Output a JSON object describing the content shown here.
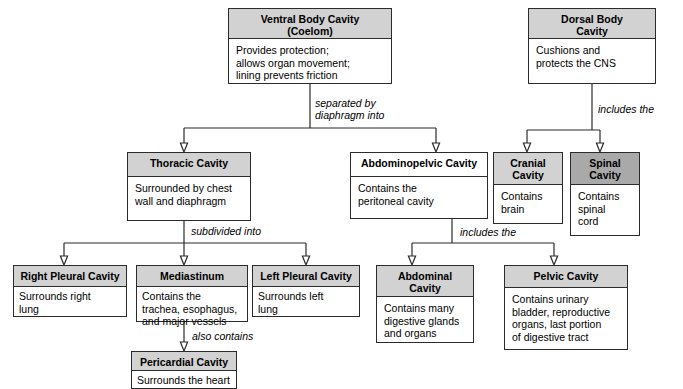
{
  "diagram": {
    "colors": {
      "header_fill": "#d2d2d2",
      "header_fill_dark": "#a9a9a9",
      "box_fill": "#ffffff",
      "line": "#2b2b2b"
    },
    "nodes": [
      {
        "id": "ventral-body-cavity",
        "header": "Ventral Body Cavity\n(Coelom)",
        "header_line1": "Ventral Body Cavity",
        "header_line2": "(Coelom)",
        "body": "Provides protection;\nallows organ movement;\nlining prevents friction",
        "body_line1": "Provides protection;",
        "body_line2": "allows organ movement;",
        "body_line3": "lining prevents friction"
      },
      {
        "id": "dorsal-body-cavity",
        "header_line1": "Dorsal Body",
        "header_line2": "Cavity",
        "body_line1": "Cushions and",
        "body_line2": "protects the CNS"
      },
      {
        "id": "thoracic-cavity",
        "header_line1": "Thoracic Cavity",
        "body_line1": "Surrounded by chest",
        "body_line2": "wall and diaphragm"
      },
      {
        "id": "abdominopelvic-cavity",
        "header_line1": "Abdominopelvic Cavity",
        "body_line1": "Contains the",
        "body_line2": "peritoneal cavity"
      },
      {
        "id": "cranial-cavity",
        "header_line1": "Cranial",
        "header_line2": "Cavity",
        "body_line1": "Contains",
        "body_line2": "brain"
      },
      {
        "id": "spinal-cavity",
        "header_line1": "Spinal",
        "header_line2": "Cavity",
        "body_line1": "Contains",
        "body_line2": "spinal",
        "body_line3": "cord"
      },
      {
        "id": "right-pleural-cavity",
        "header_line1": "Right Pleural Cavity",
        "body_line1": "Surrounds right",
        "body_line2": "lung"
      },
      {
        "id": "mediastinum",
        "header_line1": "Mediastinum",
        "body_line1": "Contains the",
        "body_line2": "trachea, esophagus,",
        "body_line3": "and major vessels"
      },
      {
        "id": "left-pleural-cavity",
        "header_line1": "Left Pleural Cavity",
        "body_line1": "Surrounds left",
        "body_line2": "lung"
      },
      {
        "id": "pericardial-cavity",
        "header_line1": "Pericardial Cavity",
        "body_line1": "Surrounds the heart"
      },
      {
        "id": "abdominal-cavity",
        "header_line1": "Abdominal",
        "header_line2": "Cavity",
        "body_line1": "Contains many",
        "body_line2": "digestive glands",
        "body_line3": "and organs"
      },
      {
        "id": "pelvic-cavity",
        "header_line1": "Pelvic Cavity",
        "body_line1": "Contains urinary",
        "body_line2": "bladder, reproductive",
        "body_line3": "organs, last portion",
        "body_line4": "of digestive tract"
      }
    ],
    "edge_labels": {
      "separated_by_diaphragm_line1": "separated by",
      "separated_by_diaphragm_line2": "diaphragm into",
      "includes_the_dorsal": "includes the",
      "subdivided_into": "subdivided into",
      "includes_the_abdominopelvic": "includes the",
      "also_contains": "also contains"
    }
  }
}
